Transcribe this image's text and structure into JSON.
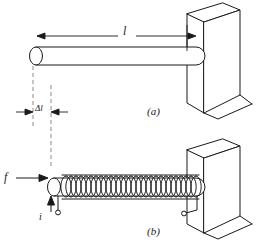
{
  "figure": {
    "type": "line-diagram",
    "background_color": "#ffffff",
    "line_color": "#1a1a1a",
    "fill_color": "#ffffff",
    "dash_color": "#808080",
    "panels": [
      {
        "id": "a",
        "caption": "(a)",
        "labels": [
          {
            "name": "length-label",
            "text": "l"
          },
          {
            "name": "delta-length-label",
            "text": "Δl"
          }
        ]
      },
      {
        "id": "b",
        "caption": "(b)",
        "labels": [
          {
            "name": "force-label",
            "text": "f"
          },
          {
            "name": "current-label",
            "text": "i"
          }
        ]
      }
    ],
    "captions": {
      "a": "(a)",
      "b": "(b)"
    },
    "dimension_labels": {
      "length": "l",
      "delta_length": "Δl"
    },
    "vector_labels": {
      "force": "f",
      "current": "i"
    },
    "coil_turns": 27
  }
}
